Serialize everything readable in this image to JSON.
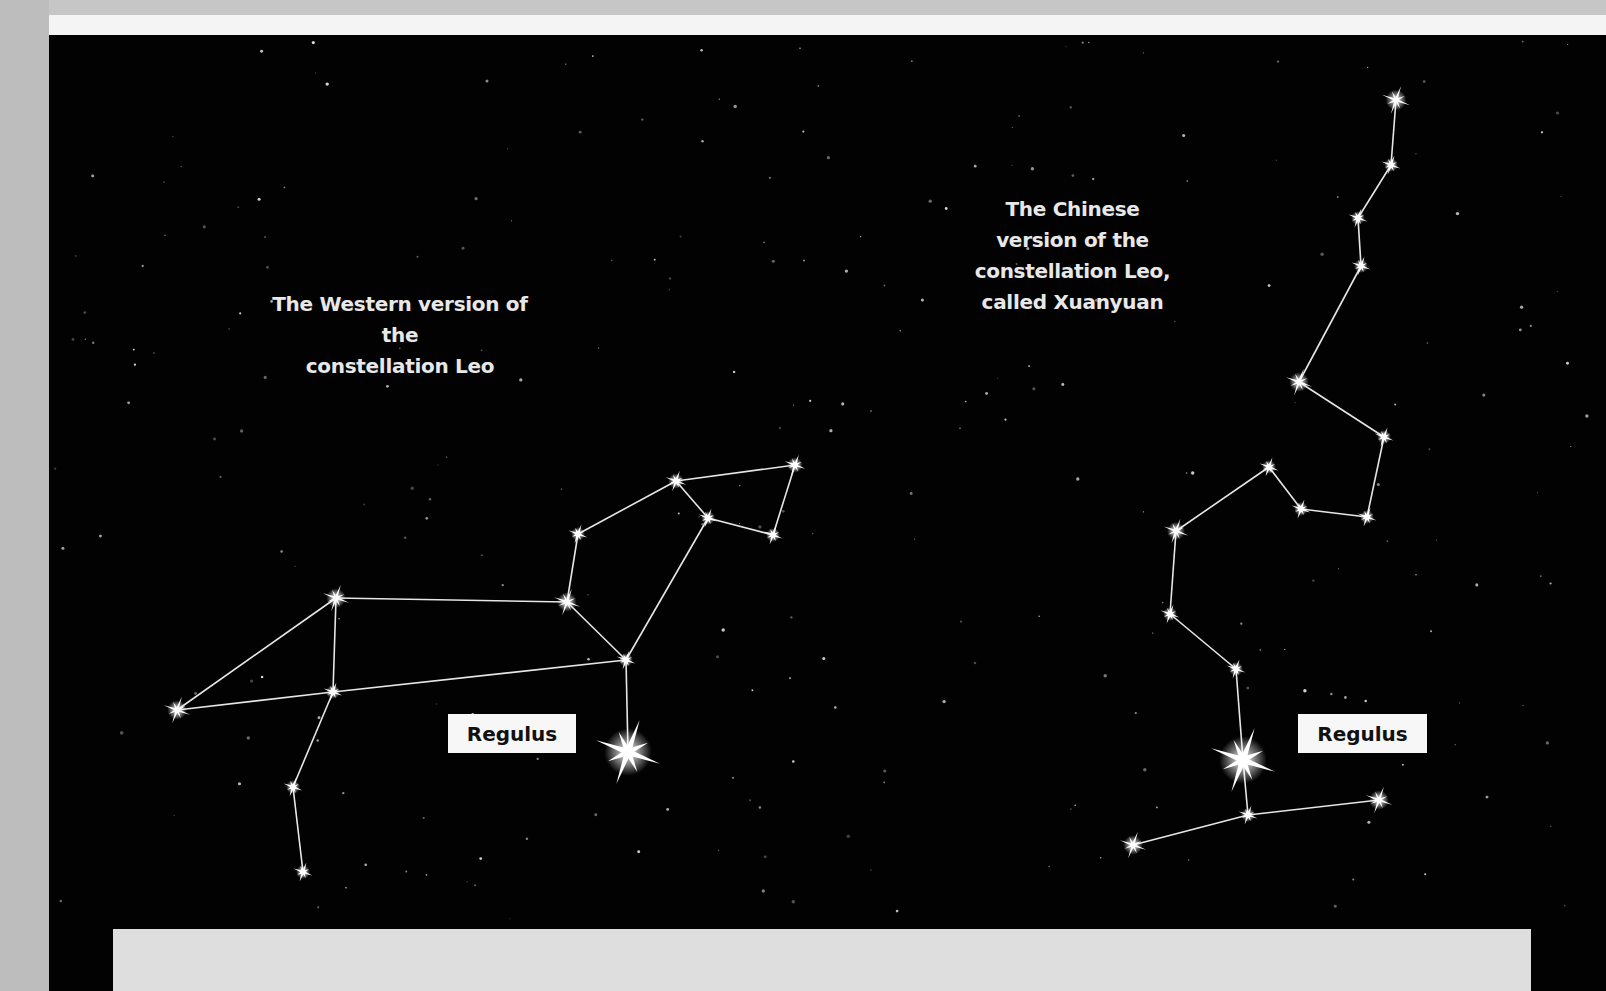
{
  "illustration": {
    "background_color": "#020202",
    "star_color": "#ffffff",
    "line_color": "#e6e6e6"
  },
  "captions": {
    "western": "The Western version of the\nconstellation Leo",
    "chinese": "The Chinese\nversion of the\nconstellation Leo,\ncalled Xuanyuan"
  },
  "labels": {
    "western_regulus": "Regulus",
    "chinese_regulus": "Regulus"
  },
  "constellations": [
    {
      "name": "Leo (Western)",
      "stars": [
        {
          "id": "a",
          "x": 177,
          "y": 710,
          "size": 14
        },
        {
          "id": "b",
          "x": 336,
          "y": 598,
          "size": 14
        },
        {
          "id": "c",
          "x": 333,
          "y": 692,
          "size": 10
        },
        {
          "id": "d",
          "x": 293,
          "y": 787,
          "size": 10
        },
        {
          "id": "e",
          "x": 303,
          "y": 872,
          "size": 10
        },
        {
          "id": "f",
          "x": 567,
          "y": 602,
          "size": 14
        },
        {
          "id": "g",
          "x": 578,
          "y": 534,
          "size": 10
        },
        {
          "id": "h",
          "x": 676,
          "y": 481,
          "size": 11
        },
        {
          "id": "i",
          "x": 795,
          "y": 465,
          "size": 11
        },
        {
          "id": "j",
          "x": 708,
          "y": 518,
          "size": 10
        },
        {
          "id": "k",
          "x": 773,
          "y": 535,
          "size": 10
        },
        {
          "id": "l",
          "x": 626,
          "y": 660,
          "size": 10
        },
        {
          "id": "regulus",
          "x": 628,
          "y": 752,
          "size": 34
        }
      ],
      "lines": [
        [
          "a",
          "b"
        ],
        [
          "a",
          "c"
        ],
        [
          "c",
          "l"
        ],
        [
          "b",
          "c"
        ],
        [
          "c",
          "d"
        ],
        [
          "d",
          "e"
        ],
        [
          "b",
          "f"
        ],
        [
          "f",
          "g"
        ],
        [
          "g",
          "h"
        ],
        [
          "h",
          "i"
        ],
        [
          "i",
          "k"
        ],
        [
          "k",
          "j"
        ],
        [
          "j",
          "h"
        ],
        [
          "j",
          "l"
        ],
        [
          "f",
          "l"
        ],
        [
          "l",
          "regulus"
        ]
      ]
    },
    {
      "name": "Xuanyuan (Chinese)",
      "stars": [
        {
          "id": "1",
          "x": 1396,
          "y": 100,
          "size": 15
        },
        {
          "id": "2",
          "x": 1391,
          "y": 165,
          "size": 10
        },
        {
          "id": "3",
          "x": 1358,
          "y": 218,
          "size": 10
        },
        {
          "id": "4",
          "x": 1361,
          "y": 266,
          "size": 10
        },
        {
          "id": "5",
          "x": 1299,
          "y": 382,
          "size": 14
        },
        {
          "id": "6",
          "x": 1384,
          "y": 437,
          "size": 10
        },
        {
          "id": "7",
          "x": 1367,
          "y": 517,
          "size": 10
        },
        {
          "id": "8",
          "x": 1301,
          "y": 509,
          "size": 10
        },
        {
          "id": "9",
          "x": 1269,
          "y": 467,
          "size": 10
        },
        {
          "id": "10",
          "x": 1176,
          "y": 531,
          "size": 13
        },
        {
          "id": "11",
          "x": 1170,
          "y": 614,
          "size": 10
        },
        {
          "id": "12",
          "x": 1236,
          "y": 669,
          "size": 10
        },
        {
          "id": "regulus",
          "x": 1243,
          "y": 760,
          "size": 34
        },
        {
          "id": "13",
          "x": 1248,
          "y": 815,
          "size": 10
        },
        {
          "id": "14",
          "x": 1133,
          "y": 845,
          "size": 14
        },
        {
          "id": "15",
          "x": 1379,
          "y": 800,
          "size": 14
        }
      ],
      "lines": [
        [
          "1",
          "2"
        ],
        [
          "2",
          "3"
        ],
        [
          "3",
          "4"
        ],
        [
          "4",
          "5"
        ],
        [
          "5",
          "6"
        ],
        [
          "6",
          "7"
        ],
        [
          "7",
          "8"
        ],
        [
          "8",
          "9"
        ],
        [
          "9",
          "10"
        ],
        [
          "10",
          "11"
        ],
        [
          "11",
          "12"
        ],
        [
          "12",
          "regulus"
        ],
        [
          "regulus",
          "13"
        ],
        [
          "13",
          "14"
        ],
        [
          "13",
          "15"
        ]
      ]
    }
  ]
}
